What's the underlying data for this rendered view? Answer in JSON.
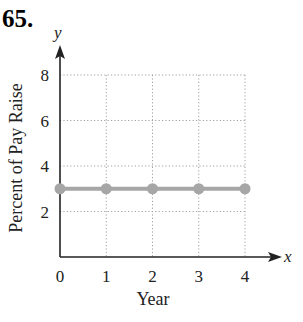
{
  "problem_number": "65.",
  "chart_data": {
    "type": "line",
    "title": "",
    "xlabel": "Year",
    "ylabel": "Percent of Pay Raise",
    "x_axis_name": "x",
    "y_axis_name": "y",
    "x": [
      0,
      1,
      2,
      3,
      4
    ],
    "series": [
      {
        "name": "Percent of Pay Raise",
        "values": [
          3,
          3,
          3,
          3,
          3
        ]
      }
    ],
    "x_ticks": [
      "0",
      "1",
      "2",
      "3",
      "4"
    ],
    "y_ticks": [
      "2",
      "4",
      "6",
      "8"
    ],
    "xlim": [
      0,
      4
    ],
    "ylim": [
      0,
      8
    ],
    "grid": true,
    "legend": "none"
  },
  "colors": {
    "line": "#a6a6a6",
    "axis": "#222222",
    "grid": "#a0a0a0"
  }
}
